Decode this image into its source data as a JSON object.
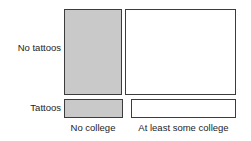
{
  "chart_data": {
    "type": "mosaic",
    "title": "",
    "subtitle": "",
    "xlabel": "",
    "ylabel": "",
    "grid": false,
    "legend": "none",
    "row_categories": [
      "No tattoos",
      "Tattoos"
    ],
    "column_categories": [
      "No college",
      "At least some college"
    ],
    "cells": [
      {
        "row": "No tattoos",
        "column": "No college",
        "fill": "#c9c9c9",
        "width_fraction": 0.34,
        "height_fraction": 0.82
      },
      {
        "row": "No tattoos",
        "column": "At least some college",
        "fill": "#ffffff",
        "width_fraction": 0.66,
        "height_fraction": 0.82
      },
      {
        "row": "Tattoos",
        "column": "No college",
        "fill": "#c9c9c9",
        "width_fraction": 0.34,
        "height_fraction": 0.18
      },
      {
        "row": "Tattoos",
        "column": "At least some college",
        "fill": "#ffffff",
        "width_fraction": 0.66,
        "height_fraction": 0.18
      }
    ],
    "colors": {
      "filled": "#c9c9c9",
      "hollow": "#ffffff",
      "border": "#3c3c3c",
      "text": "#1d1d1d",
      "background": "#ffffff"
    }
  },
  "labels": {
    "row_no_tattoos": "No tattoos",
    "row_tattoos": "Tattoos",
    "col_no_college": "No college",
    "col_some_college": "At least some college"
  }
}
